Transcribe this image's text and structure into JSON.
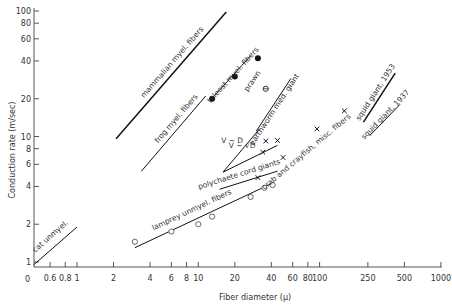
{
  "chart_data": {
    "type": "scatter",
    "title": "",
    "xlabel": "Fiber diameter (μ)",
    "ylabel": "Conduction rate (m/sec)",
    "xscale": "log",
    "yscale": "log",
    "xlim": [
      0.4,
      1000
    ],
    "ylim": [
      0.9,
      100
    ],
    "grid": false,
    "x_ticks": [
      {
        "v": 0.6,
        "label": "0.6"
      },
      {
        "v": 0.8,
        "label": "0.8"
      },
      {
        "v": 1,
        "label": "1"
      },
      {
        "v": 2,
        "label": "2"
      },
      {
        "v": 4,
        "label": "4"
      },
      {
        "v": 6,
        "label": "6"
      },
      {
        "v": 8,
        "label": "8"
      },
      {
        "v": 10,
        "label": "10"
      },
      {
        "v": 20,
        "label": "20"
      },
      {
        "v": 40,
        "label": "40"
      },
      {
        "v": 60,
        "label": "60"
      },
      {
        "v": 80,
        "label": "80"
      },
      {
        "v": 100,
        "label": "100"
      },
      {
        "v": 250,
        "label": "250"
      },
      {
        "v": 500,
        "label": "500"
      },
      {
        "v": 1000,
        "label": "1000"
      }
    ],
    "x_origin_label": "0",
    "y_ticks": [
      {
        "v": 1,
        "label": "1"
      },
      {
        "v": 2,
        "label": "2"
      },
      {
        "v": 4,
        "label": "4"
      },
      {
        "v": 6,
        "label": "6"
      },
      {
        "v": 8,
        "label": "8"
      },
      {
        "v": 10,
        "label": "10"
      },
      {
        "v": 20,
        "label": "20"
      },
      {
        "v": 40,
        "label": "40"
      },
      {
        "v": 60,
        "label": "60"
      },
      {
        "v": 80,
        "label": "80"
      },
      {
        "v": 100,
        "label": "100"
      }
    ],
    "lines": [
      {
        "name": "cat unmyel.",
        "from": [
          0.44,
          0.95
        ],
        "to": [
          1.0,
          1.9
        ],
        "label_pos": [
          0.62,
          1.55
        ],
        "thick": false
      },
      {
        "name": "mammalian myel. fibers",
        "from": [
          2.1,
          9.6
        ],
        "to": [
          17,
          98
        ],
        "label_pos": [
          6.3,
          38
        ],
        "thick": true
      },
      {
        "name": "frog myel. fibers",
        "from": [
          3.4,
          5.3
        ],
        "to": [
          11.5,
          21
        ],
        "label_pos": [
          6.8,
          13.5
        ],
        "thick": false
      },
      {
        "name": "teleost myel. fibers",
        "from": [
          13.5,
          21
        ],
        "to": [
          27,
          44
        ],
        "label_pos": [
          20,
          30
        ],
        "thick": false
      },
      {
        "name": "earthworm med. giant",
        "from": [
          30,
          11
        ],
        "to": [
          58,
          29
        ],
        "label_pos": [
          44,
          16
        ],
        "thick": false
      },
      {
        "name": "squid giant, 1953",
        "from": [
          230,
          13
        ],
        "to": [
          420,
          32
        ],
        "label_pos": [
          300,
          22
        ],
        "thick": true
      },
      {
        "name": "squid giant, 1937",
        "from": [
          260,
          10.2
        ],
        "to": [
          460,
          18
        ],
        "label_pos": [
          360,
          14.5
        ],
        "thick": false
      },
      {
        "name": "polychaete cord giants",
        "from": [
          15,
          3.8
        ],
        "to": [
          45,
          5.3
        ],
        "label_pos": [
          22,
          4.8
        ],
        "thick": false
      },
      {
        "name": "lamprey unmyel. fibers",
        "from": [
          3,
          1.3
        ],
        "to": [
          42,
          4.3
        ],
        "label_pos": [
          9,
          2.5
        ],
        "thick": false
      },
      {
        "name": "V ~ D",
        "from": [
          16,
          5.2
        ],
        "to": [
          32,
          11.5
        ],
        "label_pos": [
          19,
          8.9
        ],
        "thick": false
      },
      {
        "name": "V ~ √D",
        "from": [
          16,
          5.2
        ],
        "to": [
          45,
          8.5
        ],
        "label_pos": [
          23,
          8.1
        ],
        "thick": false
      }
    ],
    "series": [
      {
        "name": "teleost myel. fibers",
        "marker": "filled-circle",
        "points": [
          [
            13,
            20
          ],
          [
            20,
            30
          ],
          [
            31,
            42
          ]
        ]
      },
      {
        "name": "prawn",
        "marker": "crossed-circle",
        "points": [
          [
            36,
            24
          ]
        ]
      },
      {
        "name": "crab and crayfish, misc. fibers",
        "marker": "x",
        "points": [
          [
            34,
            7.5
          ],
          [
            36,
            9.2
          ],
          [
            45,
            9.3
          ],
          [
            50,
            6.8
          ],
          [
            95,
            11.5
          ],
          [
            160,
            16
          ]
        ]
      },
      {
        "name": "polychaete cord giants",
        "marker": "x",
        "points": [
          [
            31,
            4.7
          ]
        ]
      },
      {
        "name": "lamprey unmyel. fibers",
        "marker": "open-circle",
        "points": [
          [
            3,
            1.45
          ],
          [
            6,
            1.75
          ],
          [
            10,
            2.0
          ],
          [
            13,
            2.3
          ],
          [
            27,
            3.3
          ],
          [
            35,
            3.9
          ],
          [
            41,
            4.1
          ]
        ]
      }
    ],
    "annotations": [
      {
        "text": "prawn",
        "pos": [
          29,
          27
        ],
        "rot": -56
      },
      {
        "text": "crab and crayfish, misc. fibers",
        "pos": [
          80,
          7.3
        ],
        "rot": -40
      }
    ]
  }
}
